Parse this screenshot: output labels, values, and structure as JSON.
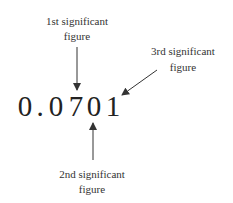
{
  "diagram": {
    "number": {
      "full": "0.0701",
      "chars": [
        "0",
        ".",
        "0",
        "7",
        "0",
        "1"
      ]
    },
    "labels": {
      "first": {
        "line1": "1st significant",
        "line2": "figure"
      },
      "second": {
        "line1": "2nd significant",
        "line2": "figure"
      },
      "third": {
        "line1": "3rd significant",
        "line2": "figure"
      }
    },
    "colors": {
      "text": "#333333",
      "arrow": "#333333",
      "background": "#ffffff"
    }
  }
}
